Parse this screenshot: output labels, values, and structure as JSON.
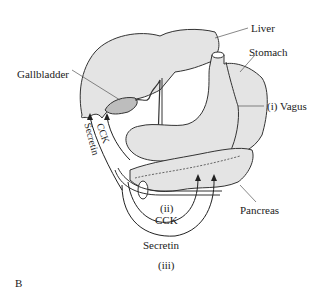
{
  "figure": {
    "panel_label": "B",
    "labels": {
      "liver": "Liver",
      "stomach": "Stomach",
      "gallbladder": "Gallbladder",
      "vagus": "(i)  Vagus",
      "pancreas": "Pancreas",
      "cck_upper": "CCK",
      "secretin_left": "Secretin",
      "ii": "(ii)",
      "cck_lower": "CCK",
      "secretin_lower": "Secretin",
      "iii": "(iii)"
    },
    "colors": {
      "organ_fill": "#e4e4e4",
      "gallbladder_fill": "#bdbdbd",
      "stroke": "#333333"
    }
  }
}
